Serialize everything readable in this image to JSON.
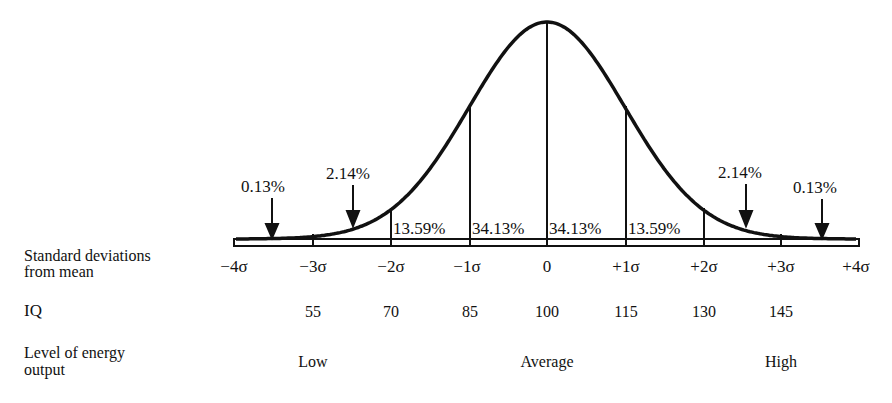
{
  "chart_data": {
    "type": "area",
    "distribution": "normal",
    "x_axis": {
      "label": "Standard deviations from mean",
      "ticks": [
        "−4σ",
        "−3σ",
        "−2σ",
        "−1σ",
        "0",
        "+1σ",
        "+2σ",
        "+3σ",
        "+4σ"
      ],
      "values": [
        -4,
        -3,
        -2,
        -1,
        0,
        1,
        2,
        3,
        4
      ]
    },
    "segments": [
      {
        "range": "below −3σ",
        "percent": "0.13%",
        "value": 0.13
      },
      {
        "range": "−3σ to −2σ",
        "percent": "2.14%",
        "value": 2.14
      },
      {
        "range": "−2σ to −1σ",
        "percent": "13.59%",
        "value": 13.59
      },
      {
        "range": "−1σ to 0",
        "percent": "34.13%",
        "value": 34.13
      },
      {
        "range": "0 to +1σ",
        "percent": "34.13%",
        "value": 34.13
      },
      {
        "range": "+1σ to +2σ",
        "percent": "13.59%",
        "value": 13.59
      },
      {
        "range": "+2σ to +3σ",
        "percent": "2.14%",
        "value": 2.14
      },
      {
        "range": "above +3σ",
        "percent": "0.13%",
        "value": 0.13
      }
    ],
    "iq_scale": {
      "label": "IQ",
      "values": [
        "55",
        "70",
        "85",
        "100",
        "115",
        "130",
        "145"
      ],
      "at_sigma": [
        -3,
        -2,
        -1,
        0,
        1,
        2,
        3
      ]
    },
    "energy_scale": {
      "label": "Level of energy output",
      "values": [
        "Low",
        "Average",
        "High"
      ]
    }
  },
  "labels": {
    "sd_row_line1": "Standard deviations",
    "sd_row_line2": "from mean",
    "iq_row": "IQ",
    "energy_row_line1": "Level of energy",
    "energy_row_line2": "output",
    "sigma_ticks": [
      "−4σ",
      "−3σ",
      "−2σ",
      "−1σ",
      "0",
      "+1σ",
      "+2σ",
      "+3σ",
      "+4σ"
    ],
    "iq_values": [
      "55",
      "70",
      "85",
      "100",
      "115",
      "130",
      "145"
    ],
    "energy_low": "Low",
    "energy_average": "Average",
    "energy_high": "High",
    "pct_inner": [
      "13.59%",
      "34.13%",
      "34.13%",
      "13.59%"
    ],
    "pct_left_tail": "0.13%",
    "pct_left_mid": "2.14%",
    "pct_right_mid": "2.14%",
    "pct_right_tail": "0.13%"
  },
  "colors": {
    "ink": "#111111",
    "background": "#ffffff"
  }
}
